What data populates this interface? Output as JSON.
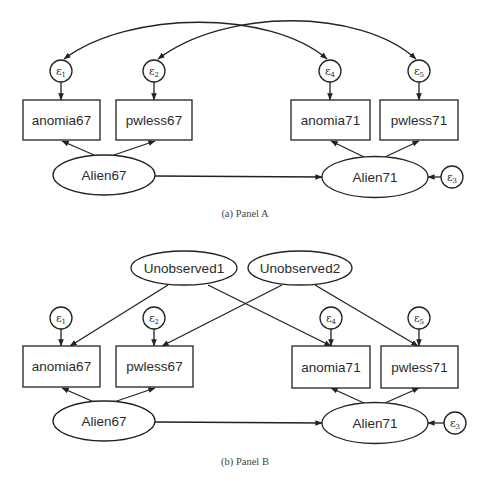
{
  "panel_a": {
    "caption": "(a) Panel A",
    "observed": {
      "anomia67": "anomia67",
      "pwless67": "pwless67",
      "anomia71": "anomia71",
      "pwless71": "pwless71"
    },
    "latent": {
      "alien67": "Alien67",
      "alien71": "Alien71"
    },
    "errors": {
      "e1": {
        "base": "ε",
        "sub": "1"
      },
      "e2": {
        "base": "ε",
        "sub": "2"
      },
      "e3": {
        "base": "ε",
        "sub": "3"
      },
      "e4": {
        "base": "ε",
        "sub": "4"
      },
      "e5": {
        "base": "ε",
        "sub": "5"
      }
    },
    "covariances": [
      [
        "e1",
        "e4"
      ],
      [
        "e2",
        "e5"
      ]
    ],
    "paths": [
      [
        "Alien67",
        "anomia67"
      ],
      [
        "Alien67",
        "pwless67"
      ],
      [
        "Alien71",
        "anomia71"
      ],
      [
        "Alien71",
        "pwless71"
      ],
      [
        "Alien67",
        "Alien71"
      ],
      [
        "e3",
        "Alien71"
      ],
      [
        "e1",
        "anomia67"
      ],
      [
        "e2",
        "pwless67"
      ],
      [
        "e4",
        "anomia71"
      ],
      [
        "e5",
        "pwless71"
      ]
    ]
  },
  "panel_b": {
    "caption": "(b) Panel B",
    "observed": {
      "anomia67": "anomia67",
      "pwless67": "pwless67",
      "anomia71": "anomia71",
      "pwless71": "pwless71"
    },
    "latent": {
      "alien67": "Alien67",
      "alien71": "Alien71",
      "unobserved1": "Unobserved1",
      "unobserved2": "Unobserved2"
    },
    "errors": {
      "e1": {
        "base": "ε",
        "sub": "1"
      },
      "e2": {
        "base": "ε",
        "sub": "2"
      },
      "e3": {
        "base": "ε",
        "sub": "3"
      },
      "e4": {
        "base": "ε",
        "sub": "4"
      },
      "e5": {
        "base": "ε",
        "sub": "5"
      }
    },
    "paths": [
      [
        "Unobserved1",
        "anomia67"
      ],
      [
        "Unobserved1",
        "anomia71"
      ],
      [
        "Unobserved2",
        "pwless67"
      ],
      [
        "Unobserved2",
        "pwless71"
      ],
      [
        "Alien67",
        "anomia67"
      ],
      [
        "Alien67",
        "pwless67"
      ],
      [
        "Alien71",
        "anomia71"
      ],
      [
        "Alien71",
        "pwless71"
      ],
      [
        "Alien67",
        "Alien71"
      ],
      [
        "e3",
        "Alien71"
      ],
      [
        "e1",
        "anomia67"
      ],
      [
        "e2",
        "pwless67"
      ],
      [
        "e4",
        "anomia71"
      ],
      [
        "e5",
        "pwless71"
      ]
    ]
  }
}
